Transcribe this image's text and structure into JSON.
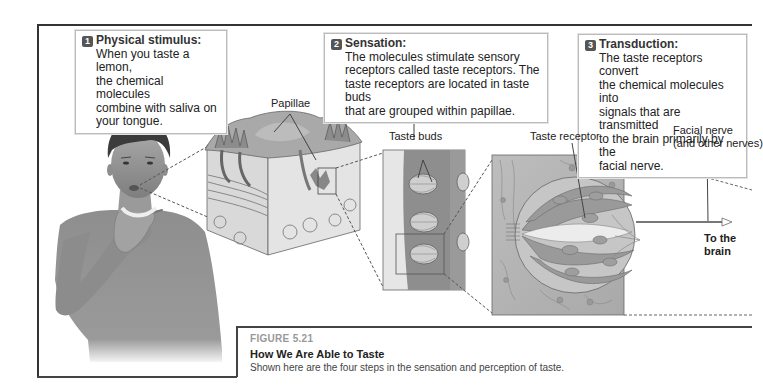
{
  "figure": {
    "number": "FIGURE 5.21",
    "title": "How We Are Able to Taste",
    "description": "Shown here are the four steps in the sensation and perception of taste."
  },
  "callouts": [
    {
      "step": "1",
      "heading": "Physical stimulus:",
      "lines": [
        "When you taste a lemon,",
        "the chemical molecules",
        "combine with saliva on",
        "your tongue."
      ]
    },
    {
      "step": "2",
      "heading": "Sensation:",
      "lines": [
        "The molecules stimulate sensory",
        "receptors called taste receptors. The",
        "taste receptors are located in taste buds",
        "that are grouped within papillae."
      ]
    },
    {
      "step": "3",
      "heading": "Transduction:",
      "lines": [
        "The taste receptors convert",
        "the chemical molecules into",
        "signals that are transmitted",
        "to the brain primarily by the",
        "facial nerve."
      ]
    }
  ],
  "labels": {
    "papillae": "Papillae",
    "taste_buds": "Taste buds",
    "taste_receptor": "Taste receptor",
    "facial_nerve_1": "Facial nerve",
    "facial_nerve_2": "(and other nerves)",
    "to_brain_1": "To the",
    "to_brain_2": "brain"
  },
  "illustrations": {
    "child": "child-touching-throat",
    "tongue_section": "tongue-papillae-cross-section",
    "taste_bud_column": "taste-buds-in-papilla",
    "taste_bud_detail": "taste-receptor-cells"
  },
  "colors": {
    "frame": "#333333",
    "tissue": "#8a8a8a",
    "tissue_light": "#c9c9c9",
    "skin": "#9c9c9c",
    "caption_number": "#999999"
  }
}
